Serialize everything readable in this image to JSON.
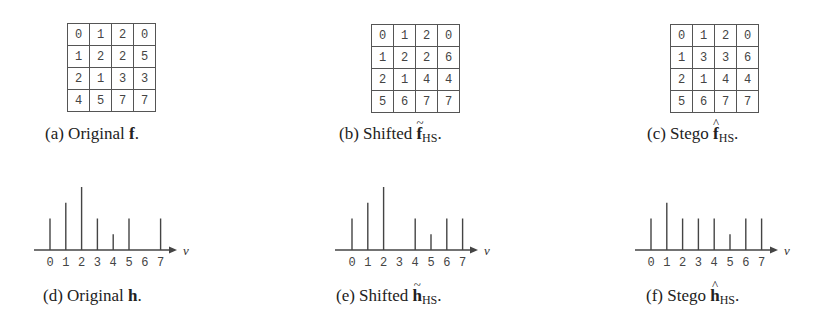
{
  "panels": {
    "a": {
      "caption_prefix": "(a) Original ",
      "caption_symbol": "f",
      "caption_accent": "",
      "caption_sub": "",
      "caption_suffix": ".",
      "grid": [
        [
          0,
          1,
          2,
          0
        ],
        [
          1,
          2,
          2,
          5
        ],
        [
          2,
          1,
          3,
          3
        ],
        [
          4,
          5,
          7,
          7
        ]
      ]
    },
    "b": {
      "caption_prefix": "(b) Shifted ",
      "caption_symbol": "f",
      "caption_accent": "~",
      "caption_sub": "HS",
      "caption_suffix": ".",
      "grid": [
        [
          0,
          1,
          2,
          0
        ],
        [
          1,
          2,
          2,
          6
        ],
        [
          2,
          1,
          4,
          4
        ],
        [
          5,
          6,
          7,
          7
        ]
      ]
    },
    "c": {
      "caption_prefix": "(c) Stego ",
      "caption_symbol": "f",
      "caption_accent": "^",
      "caption_sub": "HS",
      "caption_suffix": ".",
      "grid": [
        [
          0,
          1,
          2,
          0
        ],
        [
          1,
          3,
          3,
          6
        ],
        [
          2,
          1,
          4,
          4
        ],
        [
          5,
          6,
          7,
          7
        ]
      ]
    },
    "d": {
      "caption_prefix": "(d) Original ",
      "caption_symbol": "h",
      "caption_accent": "",
      "caption_sub": "",
      "caption_suffix": "."
    },
    "e": {
      "caption_prefix": "(e) Shifted ",
      "caption_symbol": "h",
      "caption_accent": "~",
      "caption_sub": "HS",
      "caption_suffix": "."
    },
    "f": {
      "caption_prefix": "(f) Stego ",
      "caption_symbol": "h",
      "caption_accent": "^",
      "caption_sub": "HS",
      "caption_suffix": "."
    }
  },
  "axis_label": "v",
  "tick_labels": [
    "0",
    "1",
    "2",
    "3",
    "4",
    "5",
    "6",
    "7"
  ],
  "colors": {
    "line": "#444444",
    "text": "#222222",
    "grid_border": "#555555"
  },
  "chart_data": [
    {
      "type": "bar",
      "title": "(d) Original h",
      "xlabel": "v",
      "ylabel": "",
      "categories": [
        "0",
        "1",
        "2",
        "3",
        "4",
        "5",
        "6",
        "7"
      ],
      "values": [
        2,
        3,
        4,
        2,
        1,
        2,
        0,
        2
      ],
      "grid": false,
      "legend": "none"
    },
    {
      "type": "bar",
      "title": "(e) Shifted h~HS",
      "xlabel": "v",
      "ylabel": "",
      "categories": [
        "0",
        "1",
        "2",
        "3",
        "4",
        "5",
        "6",
        "7"
      ],
      "values": [
        2,
        3,
        4,
        0,
        2,
        1,
        2,
        2
      ],
      "grid": false,
      "legend": "none"
    },
    {
      "type": "bar",
      "title": "(f) Stego h^HS",
      "xlabel": "v",
      "ylabel": "",
      "categories": [
        "0",
        "1",
        "2",
        "3",
        "4",
        "5",
        "6",
        "7"
      ],
      "values": [
        2,
        3,
        2,
        2,
        2,
        1,
        2,
        2
      ],
      "grid": false,
      "legend": "none"
    }
  ]
}
